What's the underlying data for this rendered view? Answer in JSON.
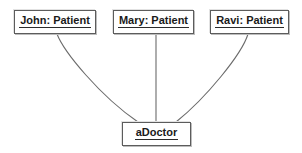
{
  "diagram": {
    "type": "uml-object-diagram",
    "title": "",
    "background_color": "#ffffff",
    "node_border_color": "#5c5c5c",
    "connector_color": "#6b6b6b",
    "text_color": "#1a1a1a",
    "nodes": [
      {
        "id": "john",
        "label": "John: Patient",
        "instance_name": "John",
        "class_name": "Patient",
        "underlined": true,
        "x": 14,
        "y": 10,
        "width": 82,
        "height": 24
      },
      {
        "id": "mary",
        "label": "Mary: Patient",
        "instance_name": "Mary",
        "class_name": "Patient",
        "underlined": true,
        "x": 113,
        "y": 10,
        "width": 81,
        "height": 24
      },
      {
        "id": "ravi",
        "label": "Ravi: Patient",
        "instance_name": "Ravi",
        "class_name": "Patient",
        "underlined": true,
        "x": 210,
        "y": 10,
        "width": 79,
        "height": 24
      },
      {
        "id": "adoctor",
        "label": "aDoctor",
        "instance_name": "aDoctor",
        "class_name": "",
        "underlined": true,
        "x": 122,
        "y": 122,
        "width": 69,
        "height": 24
      }
    ],
    "links": [
      {
        "id": "john-adoctor",
        "from": "john",
        "to": "adoctor",
        "shape": "curve",
        "path": "M 57 34 C 64 52, 100 96, 138 122"
      },
      {
        "id": "mary-adoctor",
        "from": "mary",
        "to": "adoctor",
        "shape": "line",
        "path": "M 156 34 L 156 122"
      },
      {
        "id": "ravi-adoctor",
        "from": "ravi",
        "to": "adoctor",
        "shape": "curve",
        "path": "M 248 34 C 242 54, 206 98, 176 122"
      }
    ]
  }
}
